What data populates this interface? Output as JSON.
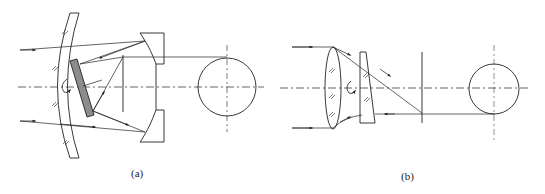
{
  "figure": {
    "panels": [
      {
        "id": "a",
        "label": "(a)",
        "description": "Catadioptric optical system with curved corrector window, rotating tilted plane mirror, concave primary mirror with central aperture, field stop and spherical target"
      },
      {
        "id": "b",
        "label": "(b)",
        "description": "Refractive optical system with objective lens, rotating optical wedge prism, field stop and spherical target"
      }
    ],
    "colors": {
      "line": "#222222",
      "mirror_fill": "#8c8c8c",
      "background": "#ffffff"
    }
  }
}
